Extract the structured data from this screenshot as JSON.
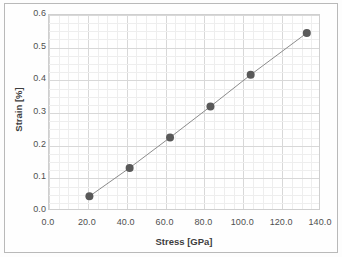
{
  "chart_data": {
    "type": "scatter",
    "title": "",
    "xlabel": "Stress [GPa]",
    "ylabel": "Strain [%]",
    "xlim": [
      0.0,
      140.0
    ],
    "ylim": [
      0.0,
      0.6
    ],
    "xticks": [
      "0.0",
      "20.0",
      "40.0",
      "60.0",
      "80.0",
      "100.0",
      "120.0",
      "140.0"
    ],
    "yticks": [
      "0.0",
      "0.1",
      "0.2",
      "0.3",
      "0.4",
      "0.5",
      "0.6"
    ],
    "xtick_values": [
      0,
      20,
      40,
      60,
      80,
      100,
      120,
      140
    ],
    "ytick_values": [
      0.0,
      0.1,
      0.2,
      0.3,
      0.4,
      0.5,
      0.6
    ],
    "grid": "major-and-minor",
    "minor_divisions": 4,
    "legend": "none",
    "marker": "filled-circle",
    "marker_color": "#595959",
    "line_style": "solid-thin",
    "line_color": "#8c8c8c",
    "x": [
      20.8,
      41.5,
      62.3,
      83.1,
      103.8,
      132.7
    ],
    "y": [
      0.045,
      0.132,
      0.225,
      0.32,
      0.417,
      0.545
    ],
    "series": [
      {
        "name": "Stress-Strain",
        "points": [
          {
            "x": 20.8,
            "y": 0.045
          },
          {
            "x": 41.5,
            "y": 0.132
          },
          {
            "x": 62.3,
            "y": 0.225
          },
          {
            "x": 83.1,
            "y": 0.32
          },
          {
            "x": 103.8,
            "y": 0.417
          },
          {
            "x": 132.7,
            "y": 0.545
          }
        ]
      }
    ]
  },
  "colors": {
    "marker": "#595959",
    "line": "#8c8c8c",
    "major_grid": "#d8d8d8",
    "minor_grid": "#efefef",
    "plot_border": "#cfcfcf",
    "text": "#4f4f4f",
    "frame": "#b9b9b9"
  }
}
